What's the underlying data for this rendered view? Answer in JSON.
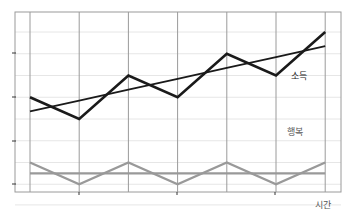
{
  "chart_data": {
    "type": "line",
    "title": "",
    "xlabel": "시간",
    "ylabel": "",
    "x": [
      0,
      1,
      2,
      3,
      4,
      5,
      6
    ],
    "series": [
      {
        "name": "소득",
        "values": [
          5.0,
          4.0,
          6.0,
          5.0,
          7.0,
          6.0,
          8.0
        ],
        "color": "#1a1a1a",
        "style": "solid"
      },
      {
        "name": "소득 추세",
        "values": [
          4.35,
          4.85,
          5.35,
          5.85,
          6.35,
          6.85,
          7.35
        ],
        "color": "#1a1a1a",
        "style": "solid-thin"
      },
      {
        "name": "행복",
        "values": [
          2.0,
          1.0,
          2.0,
          1.0,
          2.0,
          1.0,
          2.0
        ],
        "color": "#999999",
        "style": "solid"
      },
      {
        "name": "행복 평균",
        "values": [
          1.5,
          1.5,
          1.5,
          1.5,
          1.5,
          1.5,
          1.5
        ],
        "color": "#999999",
        "style": "solid-thin"
      }
    ],
    "ylim": [
      0,
      8.5
    ],
    "yticks_unlabeled": [
      0,
      2,
      4,
      6
    ],
    "xticks_unlabeled": true,
    "grid": true,
    "legend": "inline labels"
  },
  "labels": {
    "income": "소득",
    "happiness": "행복",
    "time": "시간"
  }
}
